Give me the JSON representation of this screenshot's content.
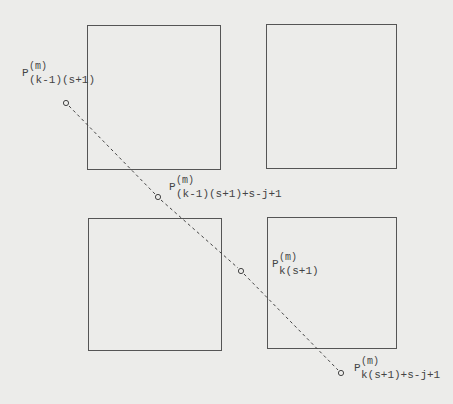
{
  "diagram": {
    "boxes": [
      {
        "id": "top-left",
        "x": 87,
        "y": 25,
        "w": 134,
        "h": 145
      },
      {
        "id": "top-right",
        "x": 266,
        "y": 24,
        "w": 131,
        "h": 145
      },
      {
        "id": "bottom-left",
        "x": 88,
        "y": 218,
        "w": 134,
        "h": 133
      },
      {
        "id": "bottom-right",
        "x": 267,
        "y": 217,
        "w": 130,
        "h": 132
      }
    ],
    "line": {
      "x1": 66,
      "y1": 103,
      "x2": 341,
      "y2": 373,
      "style": "dashed",
      "color": "#444444"
    },
    "points": [
      {
        "cx": 66,
        "cy": 103,
        "label": {
          "base": "P",
          "sup": "(m)",
          "sub": "(k-1)(s+1)",
          "x": 22,
          "y": 62
        }
      },
      {
        "cx": 158,
        "cy": 197,
        "label": {
          "base": "P",
          "sup": "(m)",
          "sub": "(k-1)(s+1)+s-j+1",
          "x": 169,
          "y": 176
        }
      },
      {
        "cx": 241,
        "cy": 271,
        "label": {
          "base": "P",
          "sup": "(m)",
          "sub": "k(s+1)",
          "x": 272,
          "y": 253
        }
      },
      {
        "cx": 341,
        "cy": 373,
        "label": {
          "base": "P",
          "sup": "(m)",
          "sub": "k(s+1)+s-j+1",
          "x": 354,
          "y": 357
        }
      }
    ]
  },
  "labels": {
    "p0": {
      "base": "P",
      "sup": "(m)",
      "sub": "(k-1)(s+1)"
    },
    "p1": {
      "base": "P",
      "sup": "(m)",
      "sub": "(k-1)(s+1)+s-j+1"
    },
    "p2": {
      "base": "P",
      "sup": "(m)",
      "sub": "k(s+1)"
    },
    "p3": {
      "base": "P",
      "sup": "(m)",
      "sub": "k(s+1)+s-j+1"
    }
  }
}
